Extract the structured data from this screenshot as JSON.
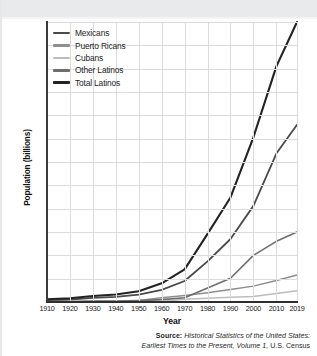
{
  "figure": {
    "y_axis_title": "Population (billions)",
    "x_axis_title": "Year",
    "source_lead": "Source:",
    "source_line1": "Historical Statistics of the United States:",
    "source_line2_italic": "Earliest Times to the Present, Volume 1,",
    "source_line2_tail": " U.S. Census"
  },
  "legend": {
    "items": [
      {
        "label": "Mexicans",
        "color": "#4a4a4a"
      },
      {
        "label": "Puerto Ricans",
        "color": "#8e8e8e"
      },
      {
        "label": "Cubans",
        "color": "#bdbdbd"
      },
      {
        "label": "Other Latinos",
        "color": "#6e6e6e"
      },
      {
        "label": "Total Latinos",
        "color": "#232323"
      }
    ]
  },
  "colors": {
    "grid": "#dcdcde",
    "axis": "#2e2e2e",
    "background": "#ffffff",
    "top_band": "#e9eaec"
  },
  "chart_data": {
    "type": "line",
    "title": "",
    "xlabel": "Year",
    "ylabel": "Population (billions)",
    "xlim": [
      1910,
      2019
    ],
    "ylim": [
      0,
      60
    ],
    "ytick_step": 5,
    "grid": true,
    "legend_position": "upper-left",
    "x": [
      1910,
      1920,
      1930,
      1940,
      1950,
      1960,
      1970,
      1980,
      1990,
      2000,
      2010,
      2019
    ],
    "xtick_labels": [
      "1910",
      "1920",
      "1930",
      "1940",
      "1950",
      "1960",
      "1970",
      "1980",
      "1990",
      "2000",
      "2010",
      "2019"
    ],
    "ytick_labels": [
      "0",
      "5",
      "10",
      "15",
      "20",
      "25",
      "30",
      "35",
      "40",
      "45",
      "50",
      "55",
      "60"
    ],
    "series": [
      {
        "name": "Total Latinos",
        "color": "#232323",
        "values": [
          0.6,
          0.8,
          1.3,
          1.6,
          2.3,
          4.0,
          7.0,
          14.6,
          22.4,
          35.3,
          50.5,
          60.0
        ]
      },
      {
        "name": "Mexicans",
        "color": "#4a4a4a",
        "values": [
          0.4,
          0.5,
          0.9,
          1.1,
          1.6,
          2.6,
          4.5,
          8.7,
          13.5,
          20.6,
          31.8,
          38.0
        ]
      },
      {
        "name": "Other Latinos",
        "color": "#6e6e6e",
        "values": [
          0.1,
          0.1,
          0.2,
          0.2,
          0.3,
          0.5,
          0.9,
          3.0,
          5.1,
          10.0,
          13.0,
          15.0
        ]
      },
      {
        "name": "Puerto Ricans",
        "color": "#8e8e8e",
        "values": [
          0.05,
          0.06,
          0.1,
          0.1,
          0.3,
          0.9,
          1.4,
          2.0,
          2.7,
          3.4,
          4.6,
          5.8
        ]
      },
      {
        "name": "Cubans",
        "color": "#bdbdbd",
        "values": [
          0.02,
          0.03,
          0.04,
          0.05,
          0.08,
          0.1,
          0.6,
          0.8,
          1.0,
          1.2,
          1.8,
          2.4
        ]
      }
    ]
  }
}
